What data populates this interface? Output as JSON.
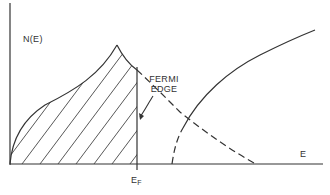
{
  "diagram": {
    "y_axis_label": "N(E)",
    "x_axis_label": "E",
    "fermi_label_line1": "FERMI",
    "fermi_label_line2": "EDGE",
    "fermi_energy_label": "E",
    "fermi_energy_subscript": "F",
    "colors": {
      "line": "#333333",
      "background": "#ffffff"
    }
  }
}
